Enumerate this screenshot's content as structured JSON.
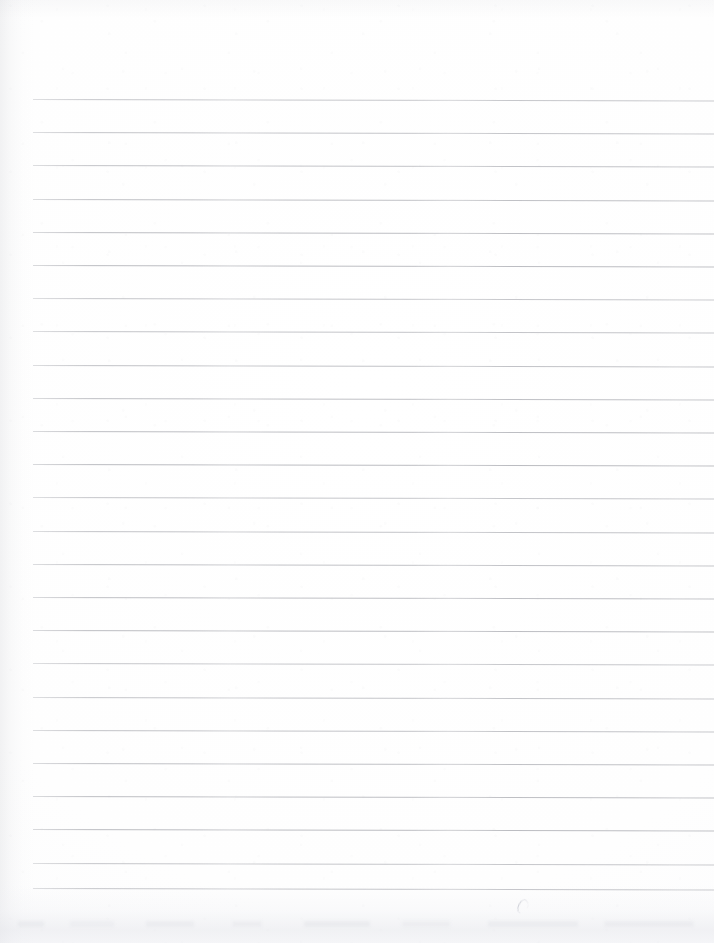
{
  "document": {
    "kind": "scanned-page",
    "title": "Blank Ruled Notebook Page",
    "page_width": 714,
    "page_height": 943,
    "background_color": "#ffffff",
    "paper_tint": "#fdfdfe",
    "has_visible_text": false,
    "visible_text": "",
    "orientation": "portrait"
  },
  "ruling": {
    "style": "horizontal-ruled",
    "line_color": "#b9babf",
    "line_thickness_px": 1,
    "line_count": 25,
    "first_line_y": 99,
    "line_spacing_px": 33.2,
    "left_margin_x": 33,
    "right_edge_x": 714,
    "skew_degrees": 0.13,
    "lines_y": [
      99,
      132.2,
      165.4,
      198.6,
      231.8,
      265,
      298.2,
      331.4,
      364.6,
      397.8,
      431,
      464.2,
      497.4,
      530.6,
      563.8,
      597,
      630.2,
      663.4,
      696.6,
      729.8,
      763,
      796.2,
      829.4,
      862.6,
      888
    ],
    "top_margin_blank_px": 99,
    "bottom_margin_blank_px": 55
  },
  "artifacts": {
    "left_edge_shadow": true,
    "top_edge_shadow": true,
    "bottom_bleed_through": true,
    "paper_grain": true,
    "blemish": {
      "x": 518,
      "y": 899,
      "description": "small pale crescent scan mark"
    }
  },
  "content": {
    "handwriting": [],
    "typed_text": [],
    "notes": "The page is empty — no handwriting, printing, headers, page numbers or margin rule are present."
  }
}
